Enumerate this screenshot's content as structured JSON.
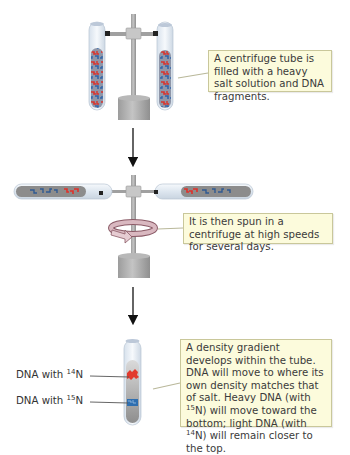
{
  "steps": [
    {
      "id": "fill",
      "callout": "A centrifuge tube is filled with a heavy salt solution and DNA fragments."
    },
    {
      "id": "spin",
      "callout": "It is then spun in a centrifuge at high speeds for several days."
    },
    {
      "id": "gradient",
      "callout_parts": {
        "p1": "A density gradient develops within the tube. DNA will move to where its own density matches that of salt. Heavy DNA (with ",
        "sup1": "15",
        "p2": "N) will move toward the bottom; light DNA (with ",
        "sup2": "14",
        "p3": "N) will remain closer to the top."
      },
      "labels": [
        {
          "prefix": "DNA with ",
          "sup": "14",
          "suffix": "N"
        },
        {
          "prefix": "DNA with ",
          "sup": "15",
          "suffix": "N"
        }
      ]
    }
  ],
  "colors": {
    "callout_bg": "#fcfbdc",
    "callout_border": "#c9c79a",
    "dna_light": "#e23a2e",
    "dna_heavy": "#2f6fb0",
    "metal": "#a9a9a9",
    "tube_glass": "#e4ecf4"
  },
  "icons": [
    "rotation-arrow-icon",
    "down-arrow-icon"
  ]
}
